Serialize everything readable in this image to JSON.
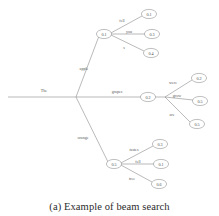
{
  "figure": {
    "caption": "(a) Example of beam search",
    "title": "Example of beam search",
    "colors": {
      "edge": "#8c8c8c",
      "node_stroke": "#8a8a8a",
      "node_fill": "#ffffff",
      "text": "#4a4a4a",
      "caption": "#2b2b2b",
      "background": "#ffffff"
    }
  },
  "diagram": {
    "type": "tree",
    "root_label": "The",
    "nodes": {
      "branch_top": "0.1",
      "branch_middle": "0.2",
      "branch_bottom": "0.5",
      "top_leaf_1": "0.1",
      "top_leaf_2": "0.3",
      "top_leaf_3": "0.4",
      "middle_leaf_1": "0.2",
      "middle_leaf_2": "0.5",
      "middle_leaf_3": "0.5",
      "bottom_leaf_1": "0.3",
      "bottom_leaf_2": "0.1",
      "bottom_leaf_3": "0.6"
    },
    "edges": {
      "root_to_top": "apple",
      "root_to_middle": "grapes",
      "root_to_bottom": "orange",
      "top_child_1": "fell",
      "top_child_2": "you",
      "top_child_3": "s",
      "middle_child_1": "were",
      "middle_child_2": "grow",
      "middle_child_3": "are",
      "bottom_child_1": "tastes",
      "bottom_child_2": "fell",
      "bottom_child_3": "tree"
    }
  }
}
